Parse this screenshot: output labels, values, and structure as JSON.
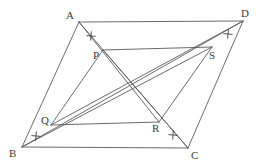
{
  "figure": {
    "background_color": "#ffffff",
    "line_color": "#5a5a5a",
    "label_color": "#3a3a3a"
  },
  "points": {
    "A": {
      "label": "A",
      "x": 79,
      "y": 22,
      "label_x": 66,
      "label_y": 19
    },
    "B": {
      "label": "B",
      "x": 22,
      "y": 147,
      "label_x": 9,
      "label_y": 157
    },
    "C": {
      "label": "C",
      "x": 188,
      "y": 148,
      "label_x": 191,
      "label_y": 159
    },
    "D": {
      "label": "D",
      "x": 243,
      "y": 21,
      "label_x": 241,
      "label_y": 17
    },
    "P": {
      "label": "P",
      "x": 103,
      "y": 50,
      "label_x": 93,
      "label_y": 59
    },
    "Q": {
      "label": "Q",
      "x": 51,
      "y": 125,
      "label_x": 41,
      "label_y": 124
    },
    "R": {
      "label": "R",
      "x": 159,
      "y": 122,
      "label_x": 152,
      "label_y": 132
    },
    "S": {
      "label": "S",
      "x": 212,
      "y": 47,
      "label_x": 209,
      "label_y": 59
    }
  },
  "segments": [
    {
      "name": "edge-AD",
      "from": "A",
      "to": "D"
    },
    {
      "name": "edge-BC",
      "from": "B",
      "to": "C"
    },
    {
      "name": "edge-AB",
      "from": "A",
      "to": "B"
    },
    {
      "name": "edge-DC",
      "from": "D",
      "to": "C"
    },
    {
      "name": "diagonal-A-P-R-C",
      "from": "A",
      "to": "C"
    },
    {
      "name": "diagonal-B-Q-S-D",
      "from": "B",
      "to": "D"
    },
    {
      "name": "inner-PS",
      "from": "P",
      "to": "S"
    },
    {
      "name": "inner-QR",
      "from": "Q",
      "to": "R"
    },
    {
      "name": "segment-PQ",
      "from": "P",
      "to": "Q"
    },
    {
      "name": "segment-RS",
      "from": "R",
      "to": "S"
    },
    {
      "name": "segment-BS",
      "from": "B",
      "to": "S"
    },
    {
      "name": "segment-QD",
      "from": "Q",
      "to": "D"
    },
    {
      "name": "segment-PC",
      "from": "P",
      "to": "C"
    },
    {
      "name": "segment-AR",
      "from": "A",
      "to": "R"
    }
  ],
  "tick_marks": [
    {
      "name": "tick-AP",
      "on_segment": "AP",
      "x": 91,
      "y": 36,
      "count": 1
    },
    {
      "name": "tick-SD",
      "on_segment": "SD",
      "x": 228,
      "y": 34,
      "count": 1
    },
    {
      "name": "tick-BQ",
      "on_segment": "BQ",
      "x": 36,
      "y": 136,
      "count": 1
    },
    {
      "name": "tick-RC",
      "on_segment": "RC",
      "x": 173,
      "y": 135,
      "count": 1
    }
  ]
}
